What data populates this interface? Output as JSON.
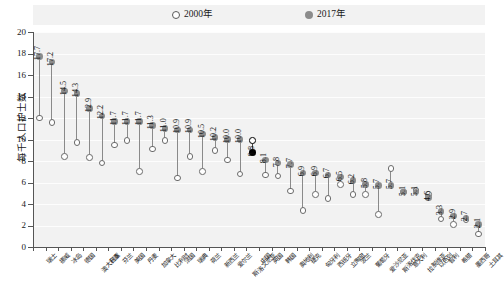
{
  "legend": {
    "items": [
      {
        "label": "2000年",
        "marker": "open-circle",
        "color": "#ffffff"
      },
      {
        "label": "2017年",
        "marker": "filled-circle",
        "color": "#8c8c8c"
      }
    ]
  },
  "axis": {
    "y_title": "每千人口护士数",
    "y_ticks": [
      "0",
      "2",
      "4",
      "6",
      "8",
      "10",
      "12",
      "14",
      "16",
      "18",
      "20"
    ]
  },
  "highlight": {
    "category": "中国",
    "color": "#000000"
  },
  "chart_data": {
    "type": "scatter",
    "title": "",
    "subtitle": "",
    "xlabel": "",
    "ylabel": "每千人口护士数",
    "ylim": [
      0,
      20
    ],
    "ytick_step": 2,
    "grid": true,
    "legend_position": "top-center",
    "annotation": "中国（8.8）以黑色标记突出显示",
    "categories": [
      "瑞士",
      "挪威",
      "冰岛",
      "德国",
      "澳大利亚",
      "日本",
      "芬兰",
      "美国",
      "丹麦",
      "加拿大",
      "比利时",
      "法国",
      "瑞典",
      "荷兰",
      "新西兰",
      "爱尔兰",
      "斯洛文尼亚",
      "中国",
      "英国",
      "韩国",
      "奥地利",
      "捷克",
      "匈牙利",
      "西班牙",
      "立陶宛",
      "波兰",
      "葡萄牙",
      "爱沙尼亚",
      "斯洛伐克",
      "意大利",
      "拉脱维亚",
      "以色列",
      "智利",
      "希腊",
      "墨西哥",
      "土耳其"
    ],
    "series": [
      {
        "name": "2017年",
        "marker": "filled-circle",
        "color": "#8c8c8c",
        "values": [
          17.7,
          17.2,
          14.5,
          14.3,
          12.9,
          12.2,
          11.7,
          11.7,
          11.7,
          11.3,
          11.0,
          10.9,
          10.9,
          10.5,
          10.2,
          10.0,
          10.0,
          8.8,
          8.1,
          7.8,
          7.7,
          6.9,
          6.9,
          6.7,
          6.5,
          6.2,
          5.8,
          5.7,
          5.7,
          5.1,
          5.1,
          4.6,
          3.3,
          2.9,
          2.7,
          2.1
        ]
      },
      {
        "name": "2000年",
        "marker": "open-circle",
        "color": "#ffffff",
        "values": [
          12.0,
          11.6,
          8.4,
          9.7,
          8.3,
          7.8,
          9.5,
          9.9,
          7.0,
          9.1,
          9.9,
          6.4,
          8.4,
          7.0,
          9.0,
          8.1,
          6.8,
          9.9,
          6.7,
          6.6,
          5.2,
          3.4,
          4.9,
          4.5,
          5.8,
          4.9,
          4.9,
          3.0,
          7.3,
          5.1,
          5.3,
          4.9,
          2.6,
          2.1,
          2.5,
          1.2
        ]
      }
    ],
    "value_labels_2017": [
      "17.7",
      "17.2",
      "14.5",
      "14.3",
      "12.9",
      "12.2",
      "11.7",
      "11.7",
      "11.7",
      "11.3",
      "11.0",
      "10.9",
      "10.9",
      "10.5",
      "10.2",
      "10.0",
      "10.0",
      "8.8",
      "8.1",
      "7.8",
      "7.7",
      "6.9",
      "6.9",
      "6.7",
      "6.5",
      "6.2",
      "5.8",
      "5.7",
      "5.7",
      "5.1",
      "5.1",
      "4.6",
      "3.3",
      "2.9",
      "2.7",
      "2.1"
    ]
  }
}
